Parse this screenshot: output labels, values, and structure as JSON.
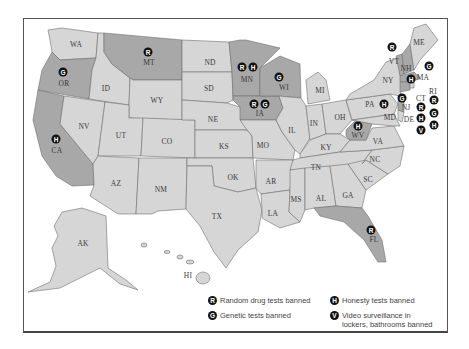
{
  "map": {
    "subject": "US states with workplace privacy bans",
    "colors": {
      "base_state": "#d6d6d6",
      "highlighted_state": "#a8a8a8",
      "marker": "#111111",
      "border": "#6f6f6f"
    },
    "states": [
      {
        "abbr": "WA",
        "x": 76,
        "y": 44,
        "highlight": false,
        "markers": []
      },
      {
        "abbr": "OR",
        "x": 64,
        "y": 83,
        "highlight": true,
        "markers": [
          {
            "code": "G",
            "x": 63,
            "y": 72
          }
        ]
      },
      {
        "abbr": "CA",
        "x": 57,
        "y": 150,
        "highlight": true,
        "markers": [
          {
            "code": "H",
            "x": 56,
            "y": 139
          }
        ]
      },
      {
        "abbr": "ID",
        "x": 106,
        "y": 88,
        "highlight": false,
        "markers": []
      },
      {
        "abbr": "NV",
        "x": 84,
        "y": 126,
        "highlight": false,
        "markers": []
      },
      {
        "abbr": "MT",
        "x": 149,
        "y": 62,
        "highlight": true,
        "markers": [
          {
            "code": "R",
            "x": 148,
            "y": 52
          }
        ]
      },
      {
        "abbr": "WY",
        "x": 157,
        "y": 100,
        "highlight": false,
        "markers": []
      },
      {
        "abbr": "UT",
        "x": 121,
        "y": 135,
        "highlight": false,
        "markers": []
      },
      {
        "abbr": "CO",
        "x": 167,
        "y": 141,
        "highlight": false,
        "markers": []
      },
      {
        "abbr": "AZ",
        "x": 116,
        "y": 183,
        "highlight": false,
        "markers": []
      },
      {
        "abbr": "NM",
        "x": 161,
        "y": 189,
        "highlight": false,
        "markers": []
      },
      {
        "abbr": "ND",
        "x": 210,
        "y": 62,
        "highlight": false,
        "markers": []
      },
      {
        "abbr": "SD",
        "x": 209,
        "y": 88,
        "highlight": false,
        "markers": []
      },
      {
        "abbr": "NE",
        "x": 213,
        "y": 119,
        "highlight": false,
        "markers": []
      },
      {
        "abbr": "KS",
        "x": 224,
        "y": 146,
        "highlight": false,
        "markers": []
      },
      {
        "abbr": "OK",
        "x": 233,
        "y": 177,
        "highlight": false,
        "markers": []
      },
      {
        "abbr": "TX",
        "x": 217,
        "y": 216,
        "highlight": false,
        "markers": []
      },
      {
        "abbr": "MN",
        "x": 247,
        "y": 79,
        "highlight": true,
        "markers": [
          {
            "code": "R",
            "x": 242,
            "y": 67
          },
          {
            "code": "H",
            "x": 253,
            "y": 67
          }
        ]
      },
      {
        "abbr": "IA",
        "x": 260,
        "y": 113,
        "highlight": true,
        "markers": [
          {
            "code": "R",
            "x": 254,
            "y": 104
          },
          {
            "code": "G",
            "x": 265,
            "y": 104
          }
        ]
      },
      {
        "abbr": "MO",
        "x": 263,
        "y": 145,
        "highlight": false,
        "markers": []
      },
      {
        "abbr": "AR",
        "x": 271,
        "y": 181,
        "highlight": false,
        "markers": []
      },
      {
        "abbr": "LA",
        "x": 273,
        "y": 213,
        "highlight": false,
        "markers": []
      },
      {
        "abbr": "WI",
        "x": 284,
        "y": 87,
        "highlight": true,
        "markers": [
          {
            "code": "G",
            "x": 279,
            "y": 77
          }
        ]
      },
      {
        "abbr": "IL",
        "x": 292,
        "y": 130,
        "highlight": false,
        "markers": []
      },
      {
        "abbr": "MI",
        "x": 320,
        "y": 90,
        "highlight": false,
        "markers": []
      },
      {
        "abbr": "IN",
        "x": 314,
        "y": 123,
        "highlight": false,
        "markers": []
      },
      {
        "abbr": "OH",
        "x": 340,
        "y": 117,
        "highlight": false,
        "markers": []
      },
      {
        "abbr": "KY",
        "x": 326,
        "y": 147,
        "highlight": false,
        "markers": []
      },
      {
        "abbr": "TN",
        "x": 316,
        "y": 167,
        "highlight": false,
        "markers": []
      },
      {
        "abbr": "MS",
        "x": 296,
        "y": 199,
        "highlight": false,
        "markers": []
      },
      {
        "abbr": "AL",
        "x": 321,
        "y": 198,
        "highlight": false,
        "markers": []
      },
      {
        "abbr": "GA",
        "x": 348,
        "y": 195,
        "highlight": false,
        "markers": []
      },
      {
        "abbr": "FL",
        "x": 374,
        "y": 239,
        "highlight": true,
        "markers": [
          {
            "code": "R",
            "x": 371,
            "y": 230
          }
        ]
      },
      {
        "abbr": "SC",
        "x": 368,
        "y": 179,
        "highlight": false,
        "markers": []
      },
      {
        "abbr": "NC",
        "x": 375,
        "y": 159,
        "highlight": false,
        "markers": []
      },
      {
        "abbr": "VA",
        "x": 378,
        "y": 141,
        "highlight": false,
        "markers": []
      },
      {
        "abbr": "WV",
        "x": 358,
        "y": 135,
        "highlight": true,
        "markers": [
          {
            "code": "H",
            "x": 358,
            "y": 126
          }
        ]
      },
      {
        "abbr": "PA",
        "x": 370,
        "y": 104,
        "highlight": false,
        "markers": []
      },
      {
        "abbr": "NY",
        "x": 388,
        "y": 80,
        "highlight": false,
        "markers": []
      },
      {
        "abbr": "VT",
        "x": 394,
        "y": 61,
        "highlight": true,
        "markers": [
          {
            "code": "R",
            "x": 392,
            "y": 47
          }
        ]
      },
      {
        "abbr": "NH",
        "x": 406,
        "y": 68,
        "highlight": true,
        "markers": []
      },
      {
        "abbr": "ME",
        "x": 419,
        "y": 42,
        "highlight": false,
        "markers": []
      },
      {
        "abbr": "MA",
        "x": 423,
        "y": 77,
        "highlight": true,
        "markers": [
          {
            "code": "H",
            "x": 411,
            "y": 79
          }
        ]
      },
      {
        "abbr": "RI",
        "x": 433,
        "y": 91,
        "highlight": false,
        "markers": []
      },
      {
        "abbr": "CT",
        "x": 421,
        "y": 98,
        "highlight": true,
        "markers": []
      },
      {
        "abbr": "NJ",
        "x": 406,
        "y": 107,
        "highlight": true,
        "markers": [
          {
            "code": "G",
            "x": 402,
            "y": 98
          }
        ]
      },
      {
        "abbr": "MD",
        "x": 390,
        "y": 117,
        "highlight": false,
        "markers": []
      },
      {
        "abbr": "DE",
        "x": 409,
        "y": 119,
        "highlight": false,
        "markers": []
      },
      {
        "abbr": "AK",
        "x": 83,
        "y": 243,
        "highlight": false,
        "markers": []
      },
      {
        "abbr": "HI",
        "x": 188,
        "y": 275,
        "highlight": false,
        "markers": []
      }
    ],
    "floating_markers": [
      {
        "code": "G",
        "x": 429,
        "y": 66,
        "for": "NH"
      },
      {
        "code": "H",
        "x": 384,
        "y": 104,
        "for": "PA"
      },
      {
        "code": "R",
        "x": 434,
        "y": 100,
        "for": "RI"
      },
      {
        "code": "G",
        "x": 434,
        "y": 113,
        "for": "RI"
      },
      {
        "code": "H",
        "x": 434,
        "y": 125,
        "for": "RI"
      },
      {
        "code": "R",
        "x": 421,
        "y": 107,
        "for": "CT"
      },
      {
        "code": "H",
        "x": 421,
        "y": 118,
        "for": "CT"
      },
      {
        "code": "V",
        "x": 421,
        "y": 130,
        "for": "CT"
      }
    ]
  },
  "legend": {
    "items": [
      {
        "code": "R",
        "label": "Random drug tests banned"
      },
      {
        "code": "G",
        "label": "Genetic tests banned"
      },
      {
        "code": "H",
        "label": "Honesty tests banned"
      },
      {
        "code": "V",
        "label": "Video surveillance in lockers, bathrooms banned",
        "line1": "Video surveillance in",
        "line2": "lockers, bathrooms banned"
      }
    ]
  }
}
